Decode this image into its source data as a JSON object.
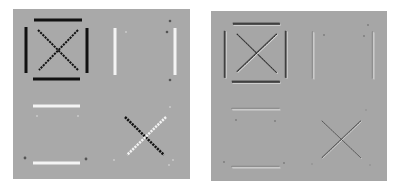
{
  "figure": {
    "background": "#ffffff",
    "panels": [
      {
        "id": "left",
        "label": "",
        "x": 13,
        "y": 9,
        "width": 177,
        "height": 170,
        "fill": "#a9a9a9",
        "style": "solid-lines",
        "elements": {
          "square_top": {
            "x1": 34,
            "y1": 20,
            "x2": 82,
            "y2": 20,
            "color": "#111111",
            "width": 3
          },
          "square_bottom": {
            "x1": 33,
            "y1": 79,
            "x2": 80,
            "y2": 79,
            "color": "#111111",
            "width": 3
          },
          "square_left": {
            "x1": 26,
            "y1": 27,
            "x2": 26,
            "y2": 73,
            "color": "#111111",
            "width": 3
          },
          "square_right": {
            "x1": 87,
            "y1": 28,
            "x2": 87,
            "y2": 73,
            "color": "#111111",
            "width": 3
          },
          "x_diag_a": {
            "x1": 38,
            "y1": 30,
            "x2": 78,
            "y2": 70,
            "color": "#111111",
            "width": 2
          },
          "x_diag_b": {
            "x1": 78,
            "y1": 30,
            "x2": 39,
            "y2": 70,
            "color": "#111111",
            "width": 2
          },
          "vbar_left": {
            "x1": 115,
            "y1": 28,
            "x2": 115,
            "y2": 75,
            "color": "#f4f4f4",
            "width": 3
          },
          "vbar_right": {
            "x1": 175,
            "y1": 28,
            "x2": 175,
            "y2": 75,
            "color": "#f4f4f4",
            "width": 3
          },
          "hbar_top": {
            "x1": 33,
            "y1": 106,
            "x2": 80,
            "y2": 106,
            "color": "#f4f4f4",
            "width": 3
          },
          "hbar_bottom": {
            "x1": 33,
            "y1": 163,
            "x2": 80,
            "y2": 163,
            "color": "#f4f4f4",
            "width": 3
          },
          "cross_dark": {
            "x1": 125,
            "y1": 117,
            "x2": 164,
            "y2": 155,
            "color": "#111111",
            "width": 2.5
          },
          "cross_light": {
            "x1": 166,
            "y1": 117,
            "x2": 127,
            "y2": 155,
            "color": "#f4f4f4",
            "width": 2.5
          }
        },
        "dots": [
          {
            "cx": 170,
            "cy": 21,
            "r": 1.3,
            "color": "#555555"
          },
          {
            "cx": 167,
            "cy": 32,
            "r": 1.3,
            "color": "#555555"
          },
          {
            "cx": 126,
            "cy": 32,
            "r": 1.1,
            "color": "#c8c8c8"
          },
          {
            "cx": 170,
            "cy": 80,
            "r": 1.3,
            "color": "#555555"
          },
          {
            "cx": 37,
            "cy": 116,
            "r": 1.1,
            "color": "#c8c8c8"
          },
          {
            "cx": 78,
            "cy": 116,
            "r": 1.1,
            "color": "#c8c8c8"
          },
          {
            "cx": 25,
            "cy": 158,
            "r": 1.4,
            "color": "#555555"
          },
          {
            "cx": 86,
            "cy": 159,
            "r": 1.4,
            "color": "#555555"
          },
          {
            "cx": 170,
            "cy": 107,
            "r": 1.1,
            "color": "#c8c8c8"
          },
          {
            "cx": 114,
            "cy": 160,
            "r": 1.1,
            "color": "#c8c8c8"
          },
          {
            "cx": 173,
            "cy": 160,
            "r": 1.1,
            "color": "#c8c8c8"
          },
          {
            "cx": 169,
            "cy": 165,
            "r": 1.1,
            "color": "#c8c8c8"
          }
        ]
      },
      {
        "id": "right",
        "label": "",
        "x": 211,
        "y": 11,
        "width": 176,
        "height": 170,
        "fill": "#a6a6a6",
        "style": "embossed-edges",
        "elements": {
          "square_top": {
            "x1": 233,
            "y1": 24,
            "x2": 280,
            "y2": 24,
            "color": "#333333",
            "width": 2.5
          },
          "square_bottom": {
            "x1": 232,
            "y1": 82,
            "x2": 280,
            "y2": 82,
            "color": "#333333",
            "width": 2.5
          },
          "square_left": {
            "x1": 225,
            "y1": 31,
            "x2": 225,
            "y2": 78,
            "color": "#333333",
            "width": 2
          },
          "square_right": {
            "x1": 286,
            "y1": 31,
            "x2": 286,
            "y2": 78,
            "color": "#333333",
            "width": 2
          },
          "x_diag_a": {
            "x1": 237,
            "y1": 34,
            "x2": 277,
            "y2": 73,
            "color": "#2a2a2a",
            "width": 1.8
          },
          "x_diag_b": {
            "x1": 277,
            "y1": 34,
            "x2": 237,
            "y2": 72,
            "color": "#2a2a2a",
            "width": 1.8
          },
          "vbar_left": {
            "x1": 313,
            "y1": 32,
            "x2": 313,
            "y2": 79,
            "color": "#f2f2f2",
            "width": 1.2
          },
          "vbar_right": {
            "x1": 373,
            "y1": 32,
            "x2": 373,
            "y2": 79,
            "color": "#f2f2f2",
            "width": 1.2
          },
          "hbar_top": {
            "x1": 232,
            "y1": 109,
            "x2": 280,
            "y2": 109,
            "color": "#f2f2f2",
            "width": 1.2
          },
          "hbar_bottom": {
            "x1": 232,
            "y1": 167,
            "x2": 280,
            "y2": 167,
            "color": "#f2f2f2",
            "width": 1.2
          },
          "cross_dark": {
            "x1": 322,
            "y1": 121,
            "x2": 361,
            "y2": 158,
            "color": "#4a4a4a",
            "width": 1.2
          },
          "cross_light": {
            "x1": 361,
            "y1": 121,
            "x2": 322,
            "y2": 158,
            "color": "#4a4a4a",
            "width": 1.2
          }
        },
        "dots": [
          {
            "cx": 368,
            "cy": 25,
            "r": 0.9,
            "color": "#7a7a7a"
          },
          {
            "cx": 324,
            "cy": 35,
            "r": 0.9,
            "color": "#7a7a7a"
          },
          {
            "cx": 364,
            "cy": 36,
            "r": 0.9,
            "color": "#7a7a7a"
          },
          {
            "cx": 236,
            "cy": 120,
            "r": 0.9,
            "color": "#7a7a7a"
          },
          {
            "cx": 275,
            "cy": 121,
            "r": 0.9,
            "color": "#7a7a7a"
          },
          {
            "cx": 224,
            "cy": 162,
            "r": 0.9,
            "color": "#7a7a7a"
          },
          {
            "cx": 284,
            "cy": 163,
            "r": 0.9,
            "color": "#7a7a7a"
          },
          {
            "cx": 366,
            "cy": 110,
            "r": 0.8,
            "color": "#8a8a8a"
          },
          {
            "cx": 312,
            "cy": 164,
            "r": 0.8,
            "color": "#8a8a8a"
          },
          {
            "cx": 370,
            "cy": 165,
            "r": 0.8,
            "color": "#8a8a8a"
          }
        ]
      }
    ]
  }
}
